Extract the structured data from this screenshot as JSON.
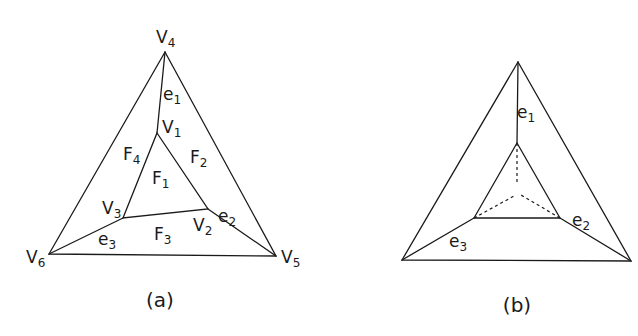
{
  "figure_a": {
    "caption": "(a)",
    "vertices": {
      "V1": {
        "base": "V",
        "sub": "1"
      },
      "V2": {
        "base": "V",
        "sub": "2"
      },
      "V3": {
        "base": "V",
        "sub": "3"
      },
      "V4": {
        "base": "V",
        "sub": "4"
      },
      "V5": {
        "base": "V",
        "sub": "5"
      },
      "V6": {
        "base": "V",
        "sub": "6"
      }
    },
    "faces": {
      "F1": {
        "base": "F",
        "sub": "1"
      },
      "F2": {
        "base": "F",
        "sub": "2"
      },
      "F3": {
        "base": "F",
        "sub": "3"
      },
      "F4": {
        "base": "F",
        "sub": "4"
      }
    },
    "edges": {
      "e1": {
        "base": "e",
        "sub": "1"
      },
      "e2": {
        "base": "e",
        "sub": "2"
      },
      "e3": {
        "base": "e",
        "sub": "3"
      }
    }
  },
  "figure_b": {
    "caption": "(b)",
    "edges": {
      "e1": {
        "base": "e",
        "sub": "1"
      },
      "e2": {
        "base": "e",
        "sub": "2"
      },
      "e3": {
        "base": "e",
        "sub": "3"
      }
    }
  }
}
